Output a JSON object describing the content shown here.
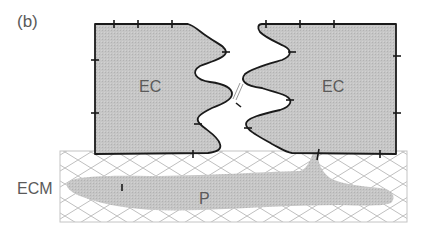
{
  "figure": {
    "panel_label": "(b)",
    "labels": {
      "ec_left": "EC",
      "ec_right": "EC",
      "ecm": "ECM",
      "p": "P"
    },
    "colors": {
      "cell_fill": "#c4c4c4",
      "outline": "#1a1a1a",
      "hatch": "#b8b8b8",
      "process_fill": "#b3b3b3",
      "text": "#5a5a5a"
    }
  }
}
